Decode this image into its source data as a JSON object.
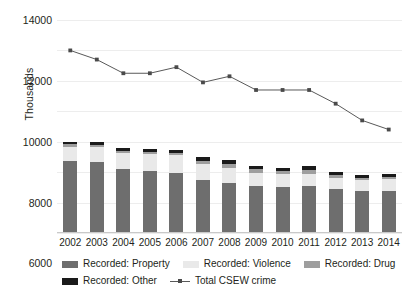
{
  "chart_data": {
    "type": "bar",
    "title": "",
    "xlabel": "",
    "ylabel": "Thousands",
    "ylim": [
      0,
      14000
    ],
    "ytick_step": 2000,
    "yticks": [
      "0",
      "2000",
      "4000",
      "6000",
      "8000",
      "10000",
      "12000",
      "14000"
    ],
    "grid": true,
    "legend_position": "bottom",
    "stacked": true,
    "categories": [
      "2002",
      "2003",
      "2004",
      "2005",
      "2006",
      "2007",
      "2008",
      "2009",
      "2010",
      "2011",
      "2012",
      "2013",
      "2014"
    ],
    "series": [
      {
        "name": "Recorded: Property",
        "kind": "bar",
        "color": "#6e6e6e",
        "values": [
          4730,
          4660,
          4180,
          4070,
          3950,
          3470,
          3310,
          3080,
          3040,
          3070,
          2880,
          2740,
          2730
        ]
      },
      {
        "name": "Recorded: Violence",
        "kind": "bar",
        "color": "#e9e9e9",
        "values": [
          950,
          990,
          1070,
          1100,
          1150,
          1060,
          970,
          880,
          830,
          830,
          750,
          720,
          800
        ]
      },
      {
        "name": "Recorded: Drug",
        "kind": "bar",
        "color": "#9e9e9e",
        "values": [
          140,
          150,
          160,
          180,
          190,
          220,
          240,
          240,
          230,
          230,
          200,
          180,
          160
        ]
      },
      {
        "name": "Recorded: Other",
        "kind": "bar",
        "color": "#1a1a1a",
        "values": [
          180,
          200,
          190,
          190,
          200,
          250,
          280,
          200,
          200,
          270,
          170,
          160,
          190
        ]
      },
      {
        "name": "Total CSEW crime",
        "kind": "line",
        "color": "#595959",
        "marker": "square",
        "values": [
          12000,
          11400,
          10500,
          10500,
          10900,
          9900,
          10300,
          9400,
          9400,
          9400,
          8500,
          7400,
          6800
        ]
      }
    ],
    "legend": [
      {
        "label": "Recorded: Property",
        "swatch_class": "sw-property"
      },
      {
        "label": "Recorded: Violence",
        "swatch_class": "sw-violence"
      },
      {
        "label": "Recorded: Drug",
        "swatch_class": "sw-drug"
      },
      {
        "label": "Recorded: Other",
        "swatch_class": "sw-other"
      },
      {
        "label": "Total CSEW crime",
        "swatch_class": "line-key"
      }
    ]
  }
}
